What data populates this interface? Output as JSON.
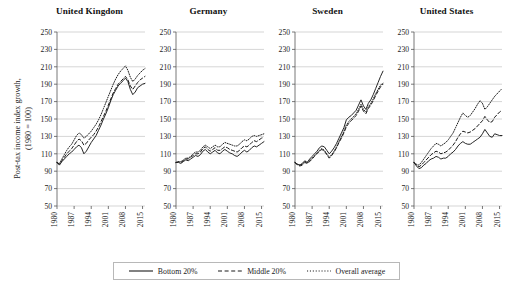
{
  "chart_data": {
    "type": "line",
    "title": "",
    "ylabel": "Post-tax income index growth,\n(1980 = 100)",
    "xlabel": "",
    "ylim": [
      50,
      250
    ],
    "yticks": [
      50,
      70,
      90,
      110,
      130,
      150,
      170,
      190,
      210,
      230,
      250
    ],
    "xlim": [
      1980,
      2016
    ],
    "xticks": [
      1980,
      1987,
      1994,
      2001,
      2008,
      2015
    ],
    "xtick_labels": [
      "1980",
      "1987",
      "1994",
      "2001",
      "2008",
      "2015"
    ],
    "grid": "horizontal",
    "legend_position": "bottom-center",
    "legend": [
      {
        "name": "Bottom 20%",
        "style": "solid"
      },
      {
        "name": "Middle 20%",
        "style": "dashed"
      },
      {
        "name": "Overall average",
        "style": "dotted"
      }
    ],
    "panels": [
      {
        "title": "United Kingdom",
        "x": [
          1980,
          1981,
          1982,
          1983,
          1984,
          1985,
          1986,
          1987,
          1988,
          1989,
          1990,
          1991,
          1992,
          1993,
          1994,
          1995,
          1996,
          1997,
          1998,
          1999,
          2000,
          2001,
          2002,
          2003,
          2004,
          2005,
          2006,
          2007,
          2008,
          2009,
          2010,
          2011,
          2012,
          2013,
          2014,
          2015,
          2016
        ],
        "series": [
          {
            "name": "Bottom 20%",
            "style": "solid",
            "values": [
              100,
              97,
              101,
              104,
              107,
              110,
              112,
              115,
              118,
              120,
              117,
              110,
              113,
              118,
              123,
              127,
              131,
              137,
              143,
              150,
              156,
              163,
              171,
              178,
              183,
              188,
              191,
              194,
              197,
              193,
              184,
              178,
              181,
              186,
              188,
              190,
              191
            ]
          },
          {
            "name": "Middle 20%",
            "style": "dashed",
            "values": [
              100,
              98,
              102,
              106,
              110,
              113,
              116,
              120,
              124,
              127,
              125,
              120,
              122,
              126,
              129,
              132,
              136,
              141,
              147,
              153,
              159,
              166,
              173,
              180,
              185,
              190,
              193,
              196,
              199,
              195,
              188,
              184,
              188,
              192,
              195,
              197,
              199
            ]
          },
          {
            "name": "Overall average",
            "style": "dotted",
            "values": [
              100,
              99,
              104,
              109,
              114,
              118,
              121,
              126,
              131,
              134,
              132,
              128,
              130,
              133,
              136,
              140,
              144,
              149,
              155,
              162,
              169,
              176,
              183,
              190,
              196,
              201,
              205,
              208,
              211,
              206,
              198,
              193,
              196,
              200,
              203,
              206,
              208
            ]
          }
        ]
      },
      {
        "title": "Germany",
        "x": [
          1980,
          1981,
          1982,
          1983,
          1984,
          1985,
          1986,
          1987,
          1988,
          1989,
          1990,
          1991,
          1992,
          1993,
          1994,
          1995,
          1996,
          1997,
          1998,
          1999,
          2000,
          2001,
          2002,
          2003,
          2004,
          2005,
          2006,
          2007,
          2008,
          2009,
          2010,
          2011,
          2012,
          2013,
          2014,
          2015,
          2016
        ],
        "series": [
          {
            "name": "Bottom 20%",
            "style": "solid",
            "values": [
              100,
              100,
              99,
              101,
              103,
              102,
              104,
              106,
              108,
              107,
              109,
              113,
              115,
              112,
              110,
              112,
              114,
              111,
              110,
              113,
              115,
              113,
              111,
              110,
              108,
              107,
              109,
              112,
              114,
              112,
              114,
              117,
              119,
              118,
              120,
              122,
              124
            ]
          },
          {
            "name": "Middle 20%",
            "style": "dashed",
            "values": [
              100,
              101,
              100,
              102,
              104,
              104,
              106,
              108,
              110,
              110,
              112,
              116,
              118,
              115,
              113,
              115,
              117,
              114,
              114,
              116,
              118,
              117,
              115,
              114,
              113,
              112,
              114,
              117,
              119,
              118,
              120,
              123,
              125,
              124,
              126,
              128,
              129
            ]
          },
          {
            "name": "Overall average",
            "style": "dotted",
            "values": [
              100,
              101,
              101,
              103,
              105,
              105,
              107,
              110,
              112,
              112,
              114,
              118,
              120,
              118,
              116,
              118,
              120,
              118,
              118,
              121,
              123,
              122,
              121,
              120,
              119,
              119,
              121,
              124,
              126,
              125,
              127,
              130,
              131,
              130,
              131,
              132,
              133
            ]
          }
        ]
      },
      {
        "title": "Sweden",
        "x": [
          1980,
          1981,
          1982,
          1983,
          1984,
          1985,
          1986,
          1987,
          1988,
          1989,
          1990,
          1991,
          1992,
          1993,
          1994,
          1995,
          1996,
          1997,
          1998,
          1999,
          2000,
          2001,
          2002,
          2003,
          2004,
          2005,
          2006,
          2007,
          2008,
          2009,
          2010,
          2011,
          2012,
          2013,
          2014,
          2015,
          2016
        ],
        "series": [
          {
            "name": "Bottom 20%",
            "style": "solid",
            "values": [
              100,
              98,
              97,
              99,
              102,
              100,
              104,
              107,
              110,
              113,
              117,
              119,
              118,
              114,
              110,
              113,
              117,
              122,
              128,
              134,
              140,
              149,
              152,
              154,
              157,
              160,
              166,
              172,
              165,
              161,
              168,
              172,
              178,
              185,
              192,
              199,
              205
            ]
          },
          {
            "name": "Middle 20%",
            "style": "dashed",
            "values": [
              100,
              97,
              96,
              97,
              100,
              99,
              101,
              104,
              107,
              110,
              113,
              115,
              113,
              109,
              105,
              108,
              112,
              117,
              123,
              128,
              134,
              141,
              145,
              148,
              151,
              154,
              159,
              165,
              159,
              156,
              162,
              166,
              171,
              177,
              182,
              187,
              190
            ]
          },
          {
            "name": "Overall average",
            "style": "dotted",
            "values": [
              100,
              98,
              97,
              98,
              101,
              100,
              102,
              105,
              108,
              111,
              114,
              116,
              114,
              110,
              106,
              109,
              113,
              118,
              124,
              130,
              136,
              143,
              147,
              150,
              153,
              156,
              161,
              167,
              161,
              158,
              164,
              168,
              173,
              179,
              184,
              189,
              191
            ]
          }
        ]
      },
      {
        "title": "United States",
        "x": [
          1980,
          1981,
          1982,
          1983,
          1984,
          1985,
          1986,
          1987,
          1988,
          1989,
          1990,
          1991,
          1992,
          1993,
          1994,
          1995,
          1996,
          1997,
          1998,
          1999,
          2000,
          2001,
          2002,
          2003,
          2004,
          2005,
          2006,
          2007,
          2008,
          2009,
          2010,
          2011,
          2012,
          2013,
          2014,
          2015,
          2016
        ],
        "series": [
          {
            "name": "Bottom 20%",
            "style": "solid",
            "values": [
              100,
              96,
              93,
              94,
              97,
              99,
              102,
              104,
              105,
              107,
              106,
              104,
              105,
              105,
              107,
              110,
              112,
              115,
              119,
              122,
              124,
              122,
              121,
              121,
              123,
              125,
              127,
              129,
              133,
              138,
              134,
              130,
              129,
              133,
              132,
              131,
              131
            ]
          },
          {
            "name": "Middle 20%",
            "style": "dashed",
            "values": [
              100,
              97,
              95,
              97,
              100,
              103,
              106,
              109,
              111,
              113,
              112,
              110,
              111,
              112,
              114,
              117,
              120,
              124,
              129,
              133,
              136,
              135,
              134,
              135,
              137,
              139,
              142,
              145,
              148,
              153,
              149,
              146,
              147,
              152,
              155,
              158,
              160
            ]
          },
          {
            "name": "Overall average",
            "style": "dotted",
            "values": [
              100,
              98,
              97,
              100,
              104,
              108,
              112,
              116,
              119,
              122,
              121,
              119,
              121,
              123,
              126,
              130,
              134,
              140,
              146,
              152,
              157,
              154,
              152,
              154,
              158,
              162,
              167,
              171,
              168,
              161,
              164,
              168,
              172,
              176,
              179,
              182,
              185
            ]
          }
        ]
      }
    ]
  }
}
